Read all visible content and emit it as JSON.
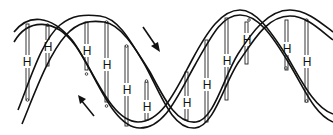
{
  "diagram": {
    "colors": {
      "stroke": "#111111",
      "background": "#ffffff"
    },
    "strands": [
      {
        "name": "strand-1",
        "label": ""
      },
      {
        "name": "strand-2",
        "label": ""
      }
    ],
    "base_pair_label": "H",
    "base_pairs": [
      {
        "x": 27,
        "label": "H"
      },
      {
        "x": 48,
        "label": "H"
      },
      {
        "x": 87,
        "label": "H"
      },
      {
        "x": 107,
        "label": "H"
      },
      {
        "x": 127,
        "label": "H"
      },
      {
        "x": 147,
        "label": "H"
      },
      {
        "x": 186,
        "label": "H"
      },
      {
        "x": 207,
        "label": "H"
      },
      {
        "x": 227,
        "label": "H"
      },
      {
        "x": 247,
        "label": "H"
      },
      {
        "x": 286,
        "label": "H"
      },
      {
        "x": 307,
        "label": "H"
      }
    ],
    "arrows": [
      {
        "name": "arrow-down-right",
        "direction": "down-right"
      },
      {
        "name": "arrow-up-left",
        "direction": "up-left"
      }
    ]
  }
}
